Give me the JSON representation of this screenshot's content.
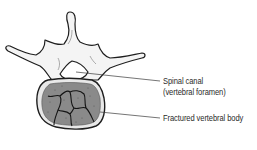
{
  "diagram": {
    "labels": {
      "spinal_canal": "Spinal canal",
      "spinal_canal_alt": "(vertebral foramen)",
      "fractured_body": "Fractured vertebral body"
    },
    "colors": {
      "bone_fill": "#f4f4f4",
      "outline": "#1e1e1e",
      "cancellous_fill": "#8a8a8a",
      "leader_line": "#3a3a3a",
      "text": "#2a2a2a"
    }
  }
}
